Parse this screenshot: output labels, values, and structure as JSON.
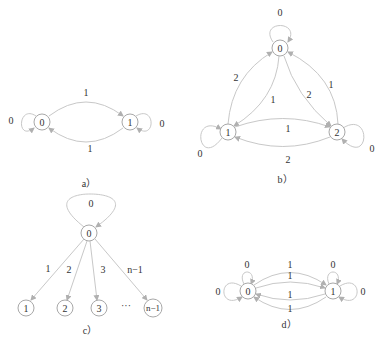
{
  "diagrams": {
    "a": {
      "caption": "a）",
      "nodes": [
        {
          "id": "0",
          "label": "0"
        },
        {
          "id": "1",
          "label": "1"
        }
      ],
      "edges": [
        {
          "from": "0",
          "to": "1",
          "label": "1"
        },
        {
          "from": "1",
          "to": "0",
          "label": "1"
        },
        {
          "from": "0",
          "to": "0",
          "label": "0"
        },
        {
          "from": "1",
          "to": "1",
          "label": "0"
        }
      ]
    },
    "b": {
      "caption": "b）",
      "nodes": [
        {
          "id": "0",
          "label": "0"
        },
        {
          "id": "1",
          "label": "1"
        },
        {
          "id": "2",
          "label": "2"
        }
      ],
      "edges": [
        {
          "from": "0",
          "to": "0",
          "label": "0"
        },
        {
          "from": "1",
          "to": "0",
          "label": "2"
        },
        {
          "from": "0",
          "to": "1",
          "label": "1"
        },
        {
          "from": "0",
          "to": "2",
          "label": "2"
        },
        {
          "from": "2",
          "to": "0",
          "label": "1"
        },
        {
          "from": "1",
          "to": "2",
          "label": "1"
        },
        {
          "from": "2",
          "to": "1",
          "label": "2"
        },
        {
          "from": "1",
          "to": "1",
          "label": "0"
        },
        {
          "from": "2",
          "to": "2",
          "label": "0"
        }
      ]
    },
    "c": {
      "caption": "c）",
      "nodes": [
        {
          "id": "0",
          "label": "0"
        },
        {
          "id": "1",
          "label": "1"
        },
        {
          "id": "2",
          "label": "2"
        },
        {
          "id": "3",
          "label": "3"
        },
        {
          "id": "n-1",
          "label": "n−1"
        }
      ],
      "ellipsis": "···",
      "edges": [
        {
          "from": "0",
          "to": "0",
          "label": "0"
        },
        {
          "from": "0",
          "to": "1",
          "label": "1"
        },
        {
          "from": "0",
          "to": "2",
          "label": "2"
        },
        {
          "from": "0",
          "to": "3",
          "label": "3"
        },
        {
          "from": "0",
          "to": "n-1",
          "label": "n−1"
        }
      ]
    },
    "d": {
      "caption": "d）",
      "nodes": [
        {
          "id": "0",
          "label": "0"
        },
        {
          "id": "1",
          "label": "1"
        }
      ],
      "edges": [
        {
          "from": "0",
          "to": "1",
          "label": "1"
        },
        {
          "from": "0",
          "to": "1",
          "label": "1"
        },
        {
          "from": "1",
          "to": "0",
          "label": "1"
        },
        {
          "from": "1",
          "to": "0",
          "label": "1"
        },
        {
          "from": "0",
          "to": "0",
          "label": "0"
        },
        {
          "from": "0",
          "to": "0",
          "label": "0"
        },
        {
          "from": "1",
          "to": "1",
          "label": "0"
        },
        {
          "from": "1",
          "to": "1",
          "label": "0"
        }
      ]
    }
  }
}
